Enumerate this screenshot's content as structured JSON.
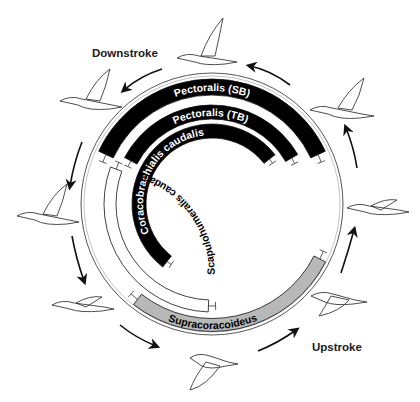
{
  "diagram": {
    "center": [
      212,
      204
    ],
    "outer_circle_radius": 131,
    "labels": {
      "downstroke": "Downstroke",
      "upstroke": "Upstroke"
    },
    "muscles": [
      {
        "id": "pectoralis-sb",
        "label": "Pectoralis (SB)",
        "fill": "#000000",
        "text_color": "#ffffff",
        "r": 117,
        "width": 16,
        "start_deg": 205,
        "end_deg": 335,
        "text_path": "top"
      },
      {
        "id": "pectoralis-tb",
        "label": "Pectoralis (TB)",
        "fill": "#000000",
        "text_color": "#ffffff",
        "r": 92,
        "width": 14,
        "start_deg": 208,
        "end_deg": 330,
        "text_path": "top"
      },
      {
        "id": "coracobrachialis-caudalis",
        "label": "Coracobrachialis caudalis",
        "fill": "#000000",
        "text_color": "#ffffff",
        "r": 73,
        "width": 14,
        "start_deg": 128,
        "end_deg": 322,
        "text_path": "top"
      },
      {
        "id": "scapulohumeralis-caudalis",
        "label": "Scapulohumeralis caudalis",
        "fill": "#ffffff",
        "text_color": "#000000",
        "r": 102,
        "width": 12,
        "start_deg": 92,
        "end_deg": 200,
        "text_path": "inside"
      },
      {
        "id": "supracoracoideus",
        "label": "Supracoracoideus",
        "fill": "#b8b8b8",
        "text_color": "#000000",
        "r": 121,
        "width": 13,
        "start_deg": 27,
        "end_deg": 128,
        "text_path": "bottom"
      }
    ],
    "birds": [
      {
        "position": "top",
        "x": 205,
        "y": 48,
        "phase": "downstroke-start"
      },
      {
        "position": "upper-left",
        "x": 88,
        "y": 95,
        "phase": "downstroke"
      },
      {
        "position": "left",
        "x": 45,
        "y": 210,
        "phase": "downstroke"
      },
      {
        "position": "lower-left",
        "x": 80,
        "y": 305,
        "phase": "downstroke-end"
      },
      {
        "position": "bottom",
        "x": 210,
        "y": 368,
        "phase": "upstroke-start"
      },
      {
        "position": "lower-right",
        "x": 335,
        "y": 300,
        "phase": "upstroke"
      },
      {
        "position": "right",
        "x": 375,
        "y": 208,
        "phase": "upstroke"
      },
      {
        "position": "upper-right",
        "x": 340,
        "y": 100,
        "phase": "upstroke-end"
      }
    ]
  }
}
